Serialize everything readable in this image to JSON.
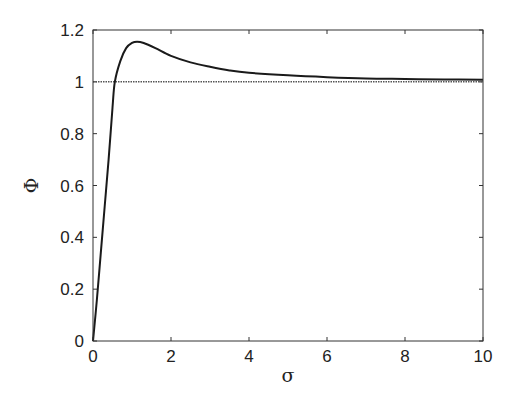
{
  "chart_data": {
    "type": "line",
    "title": "",
    "xlabel": "σ",
    "ylabel": "Φ",
    "xlim": [
      0,
      10
    ],
    "ylim": [
      0,
      1.2
    ],
    "xticks": [
      0,
      2,
      4,
      6,
      8,
      10
    ],
    "yticks": [
      0,
      0.2,
      0.4,
      0.6,
      0.8,
      1,
      1.2
    ],
    "xtick_labels": [
      "0",
      "2",
      "4",
      "6",
      "8",
      "10"
    ],
    "ytick_labels": [
      "0",
      "0.2",
      "0.4",
      "0.6",
      "0.8",
      "1",
      "1.2"
    ],
    "grid": false,
    "legend": null,
    "series": [
      {
        "name": "Phi(sigma)",
        "style": "solid",
        "color": "#1a1a1a",
        "x": [
          0,
          0.1,
          0.2,
          0.3,
          0.4,
          0.5,
          0.56,
          0.7,
          0.85,
          1.0,
          1.13,
          1.3,
          1.6,
          2.0,
          2.5,
          3.0,
          3.5,
          4.0,
          5.0,
          6.0,
          7.0,
          8.0,
          9.0,
          10.0
        ],
        "y": [
          0.0,
          0.16,
          0.34,
          0.52,
          0.7,
          0.9,
          1.0,
          1.08,
          1.13,
          1.15,
          1.155,
          1.15,
          1.13,
          1.1,
          1.075,
          1.058,
          1.044,
          1.035,
          1.025,
          1.018,
          1.013,
          1.011,
          1.009,
          1.008
        ]
      },
      {
        "name": "reference y=1",
        "style": "dotted",
        "color": "#555555",
        "x": [
          0,
          10
        ],
        "y": [
          1,
          1
        ]
      }
    ]
  }
}
